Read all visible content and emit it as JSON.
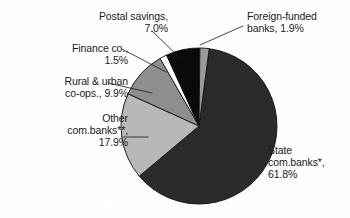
{
  "chart_data": {
    "type": "pie",
    "title": "",
    "subtitle": "",
    "xlabel": "",
    "ylabel": "",
    "legend_position": "none",
    "grid": false,
    "label_format": "name, percent",
    "units": "percent",
    "total": 100.0,
    "categories": [
      "State com.banks*",
      "Other com.banks**",
      "Rural & urban co-ops.",
      "Finance co.",
      "Postal savings",
      "Foreign-funded banks"
    ],
    "values": [
      61.8,
      17.9,
      9.9,
      1.5,
      7.0,
      1.9
    ],
    "colors": [
      "#2b2b2b",
      "#b8b8b8",
      "#8e8e8e",
      "#ffffff",
      "#0a0a0a",
      "#9a9a9a"
    ],
    "slices": [
      {
        "name": "State com.banks*",
        "value": 61.8,
        "label_lines": [
          "State",
          "com.banks*,",
          "61.8%"
        ],
        "color": "#2b2b2b"
      },
      {
        "name": "Other com.banks**",
        "value": 17.9,
        "label_lines": [
          "Other",
          "com.banks**,",
          "17.9%"
        ],
        "color": "#b8b8b8"
      },
      {
        "name": "Rural & urban co-ops.",
        "value": 9.9,
        "label_lines": [
          "Rural & urban",
          "co-ops., 9.9%"
        ],
        "color": "#8e8e8e"
      },
      {
        "name": "Finance co.",
        "value": 1.5,
        "label_lines": [
          "Finance co.,",
          "1.5%"
        ],
        "color": "#ffffff"
      },
      {
        "name": "Postal savings",
        "value": 7.0,
        "label_lines": [
          "Postal savings,",
          "7.0%"
        ],
        "color": "#0a0a0a"
      },
      {
        "name": "Foreign-funded banks",
        "value": 1.9,
        "label_lines": [
          "Foreign-funded",
          "banks, 1.9%"
        ],
        "color": "#9a9a9a"
      }
    ]
  },
  "labels": {
    "postal": "Postal savings,\n7.0%",
    "foreign": "Foreign-funded\nbanks, 1.9%",
    "finance": "Finance co.,\n1.5%",
    "rural": "Rural & urban\nco-ops., 9.9%",
    "other": "Other\ncom.banks**,\n17.9%",
    "state": "State\ncom.banks*,\n61.8%"
  },
  "style": {
    "background": "#fefefe",
    "text_color": "#1a1a1a",
    "outline_color": "#111111",
    "leader_color": "#1a1a1a"
  }
}
